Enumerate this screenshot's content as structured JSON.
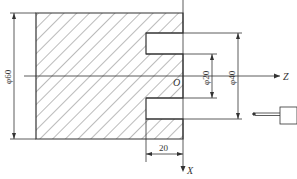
{
  "diagram": {
    "type": "turning-part-sketch",
    "dimensions": {
      "outer_diameter": "φ60",
      "groove_inner_diameter": "φ20",
      "groove_outer_diameter": "φ40",
      "groove_width": "20"
    },
    "axes": {
      "origin": "O",
      "z_axis": "Z",
      "x_axis": "X"
    },
    "colors": {
      "line": "#333333",
      "hatch": "#555555",
      "background": "#ffffff"
    }
  }
}
